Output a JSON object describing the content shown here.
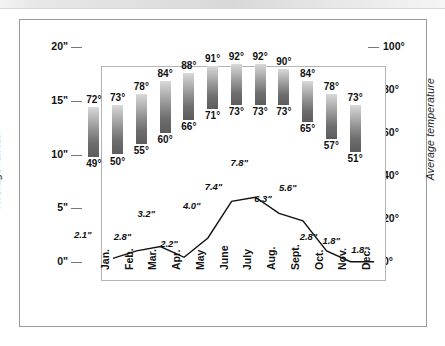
{
  "figure": {
    "top_strip_note": ""
  },
  "chart_data": {
    "type": "bar",
    "title": "",
    "categories": [
      "Jan.",
      "Feb.",
      "Mar.",
      "Apr.",
      "May",
      "June",
      "July",
      "Aug.",
      "Sept.",
      "Oct.",
      "Nov.",
      "Dec."
    ],
    "left_axis": {
      "label": "Average rainfall",
      "ticks": [
        "0\"",
        "5\"",
        "10\"",
        "15\"",
        "20\""
      ],
      "tick_values": [
        0,
        5,
        10,
        15,
        20
      ],
      "ylim": [
        0,
        20
      ],
      "unit": "inches"
    },
    "right_axis": {
      "label": "Average temperature",
      "ticks": [
        "0°",
        "20°",
        "40°",
        "60°",
        "80°",
        "100°"
      ],
      "tick_values": [
        0,
        20,
        40,
        60,
        80,
        100
      ],
      "ylim": [
        0,
        100
      ],
      "unit": "degrees Fahrenheit"
    },
    "grid": false,
    "legend": "none",
    "series": [
      {
        "name": "Average temperature range",
        "type": "bar",
        "axis": "right",
        "high_labels": [
          "72°",
          "73°",
          "78°",
          "84°",
          "88°",
          "91°",
          "92°",
          "92°",
          "90°",
          "84°",
          "78°",
          "73°"
        ],
        "low_labels": [
          "49°",
          "50°",
          "55°",
          "60°",
          "66°",
          "71°",
          "73°",
          "73°",
          "73°",
          "65°",
          "57°",
          "51°"
        ],
        "high_values": [
          72,
          73,
          78,
          84,
          88,
          91,
          92,
          92,
          90,
          84,
          78,
          73
        ],
        "low_values": [
          49,
          50,
          55,
          60,
          66,
          71,
          73,
          73,
          73,
          65,
          57,
          51
        ]
      },
      {
        "name": "Average rainfall",
        "type": "line",
        "axis": "left",
        "labels": [
          "2.1\"",
          "2.8\"",
          "3.2\"",
          "2.2\"",
          "4.0\"",
          "7.4\"",
          "7.8\"",
          "6.3\"",
          "5.6\"",
          "2.8\"",
          "1.8\"",
          "1.8\""
        ],
        "values": [
          2.1,
          2.8,
          3.2,
          2.2,
          4.0,
          7.4,
          7.8,
          6.3,
          5.6,
          2.8,
          1.8,
          1.8
        ]
      }
    ],
    "colors": {
      "bar_top": "#d9d9d9",
      "bar_bottom": "#5c5c5c",
      "line": "#111111",
      "frame": "#b4b4b4",
      "outer_frame": "#9a9a9a",
      "text": "#111111",
      "background": "#ffffff"
    }
  }
}
